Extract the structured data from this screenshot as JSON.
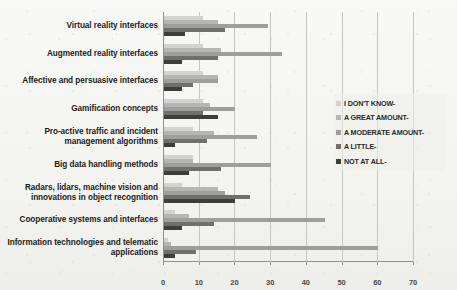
{
  "chart_data": {
    "type": "bar",
    "orientation": "horizontal",
    "title": "",
    "subtitle": "",
    "xlabel": "",
    "ylabel": "",
    "xlim": [
      0,
      70
    ],
    "xticks": [
      0,
      10,
      20,
      30,
      40,
      50,
      60,
      70
    ],
    "xtick_labels": [
      "0",
      "10",
      "20",
      "30",
      "40",
      "50",
      "60",
      "70"
    ],
    "grid": true,
    "legend_position": "right",
    "categories": [
      "Virtual reality interfaces",
      "Augmented reality interfaces",
      "Affective and  persuasive interfaces",
      "Gamification concepts",
      "Pro-active traffic and incident management algorithms",
      "Big data handling methods",
      "Radars, lidars, machine vision and innovations in object recognition",
      "Cooperative systems and interfaces",
      "Information technologies and telematic applications"
    ],
    "series": [
      {
        "name": "I DON'T KNOW-",
        "color": "#d2d2d0",
        "values": [
          11,
          11,
          11,
          11,
          8,
          8,
          5,
          3,
          1
        ]
      },
      {
        "name": "A GREAT AMOUNT-",
        "color": "#b5b5b3",
        "values": [
          15,
          16,
          15,
          13,
          14,
          8,
          15,
          7,
          2
        ]
      },
      {
        "name": "A MODERATE AMOUNT-",
        "color": "#9e9e9c",
        "values": [
          29,
          33,
          15,
          20,
          26,
          30,
          17,
          45,
          60
        ]
      },
      {
        "name": "A LITTLE-",
        "color": "#6f6f6d",
        "values": [
          17,
          15,
          8,
          11,
          12,
          16,
          24,
          14,
          9
        ]
      },
      {
        "name": "NOT AT ALL-",
        "color": "#3d3d3b",
        "values": [
          6,
          5,
          5,
          15,
          3,
          7,
          20,
          5,
          3
        ]
      }
    ]
  },
  "legend": {
    "items": [
      {
        "label": "I DON'T KNOW-",
        "color": "#d2d2d0"
      },
      {
        "label": "A GREAT AMOUNT-",
        "color": "#b5b5b3"
      },
      {
        "label": "A MODERATE AMOUNT-",
        "color": "#9e9e9c"
      },
      {
        "label": "A LITTLE-",
        "color": "#6f6f6d"
      },
      {
        "label": "NOT AT ALL-",
        "color": "#3d3d3b"
      }
    ]
  }
}
